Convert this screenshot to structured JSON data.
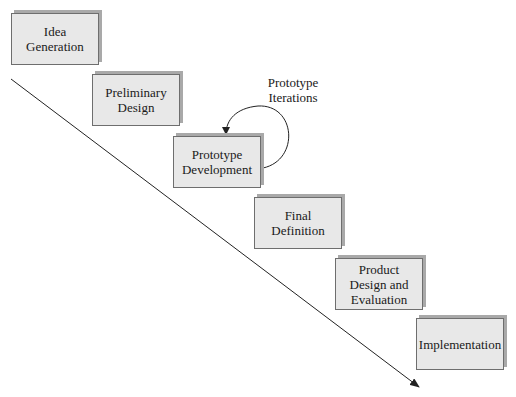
{
  "diagram": {
    "type": "waterfall-process",
    "stages": [
      {
        "id": "idea-generation",
        "label": "Idea Generation",
        "lines": [
          "Idea",
          "Generation"
        ]
      },
      {
        "id": "preliminary-design",
        "label": "Preliminary Design",
        "lines": [
          "Preliminary",
          "Design"
        ]
      },
      {
        "id": "prototype-development",
        "label": "Prototype Development",
        "lines": [
          "Prototype",
          "Development"
        ]
      },
      {
        "id": "final-definition",
        "label": "Final Definition",
        "lines": [
          "Final",
          "Definition"
        ]
      },
      {
        "id": "product-design-evaluation",
        "label": "Product Design and Evaluation",
        "lines": [
          "Product",
          "Design and",
          "Evaluation"
        ]
      },
      {
        "id": "implementation",
        "label": "Implementation",
        "lines": [
          "Implementation"
        ]
      }
    ],
    "loop": {
      "attached_to": "prototype-development",
      "label_lines": [
        "Prototype",
        "Iterations"
      ]
    },
    "flow_arrow": {
      "direction": "down-right"
    },
    "colors": {
      "box_fill": "#e8e8e8",
      "box_border": "#6e6e6e",
      "box_shadow": "#a9a9a9",
      "line": "#222222",
      "text": "#1a1a1a"
    }
  }
}
